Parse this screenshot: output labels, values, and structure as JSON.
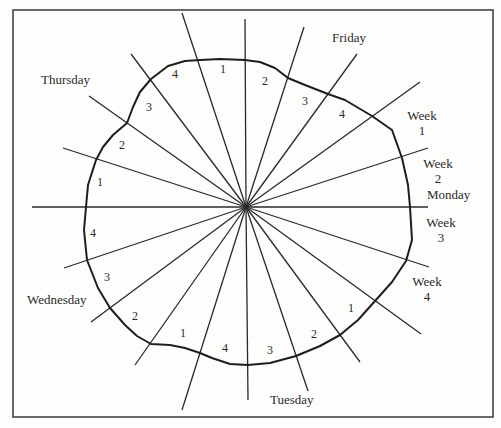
{
  "diagram": {
    "type": "radial-cycle-diagram",
    "frame": {
      "x": 13,
      "y": 10,
      "width": 480,
      "height": 407
    },
    "center": {
      "x": 246,
      "y": 207
    },
    "line_color": "#2a2a2a",
    "day_labels": {
      "thursday": "Thursday",
      "friday": "Friday",
      "monday": "Monday",
      "tuesday": "Tuesday",
      "wednesday": "Wednesday"
    },
    "week_labels": {
      "week1": {
        "word": "Week",
        "num": "1"
      },
      "week2": {
        "word": "Week",
        "num": "2"
      },
      "week3": {
        "word": "Week",
        "num": "3"
      },
      "week4": {
        "word": "Week",
        "num": "4"
      }
    },
    "segment_numbers": {
      "thu_fri": [
        "4",
        "1",
        "2",
        "3",
        "4"
      ],
      "wed_thu": [
        "1",
        "2",
        "3"
      ],
      "left": [
        "4",
        "3"
      ],
      "wed_tue": [
        "2",
        "1",
        "4",
        "3"
      ],
      "tue_mon": [
        "2",
        "1"
      ]
    },
    "rays": [
      [
        245,
        19
      ],
      [
        304,
        27
      ],
      [
        357,
        54
      ],
      [
        420,
        82
      ],
      [
        428,
        148
      ],
      [
        428,
        207
      ],
      [
        429,
        267
      ],
      [
        421,
        334
      ],
      [
        360,
        362
      ],
      [
        308,
        391
      ],
      [
        248,
        400
      ],
      [
        182,
        410
      ],
      [
        135,
        365
      ],
      [
        91,
        322
      ],
      [
        64,
        268
      ],
      [
        32,
        207
      ],
      [
        63,
        148
      ],
      [
        89,
        96
      ],
      [
        131,
        54
      ],
      [
        182,
        13
      ]
    ],
    "curve": [
      [
        245,
        60
      ],
      [
        260,
        62
      ],
      [
        275,
        68
      ],
      [
        288,
        78
      ],
      [
        305,
        85
      ],
      [
        328,
        94
      ],
      [
        345,
        100
      ],
      [
        372,
        116
      ],
      [
        392,
        130
      ],
      [
        402,
        158
      ],
      [
        408,
        185
      ],
      [
        410,
        207
      ],
      [
        412,
        240
      ],
      [
        406,
        261
      ],
      [
        392,
        282
      ],
      [
        375,
        301
      ],
      [
        358,
        320
      ],
      [
        340,
        335
      ],
      [
        320,
        346
      ],
      [
        296,
        356
      ],
      [
        270,
        363
      ],
      [
        248,
        365
      ],
      [
        230,
        364
      ],
      [
        212,
        358
      ],
      [
        200,
        353
      ],
      [
        185,
        348
      ],
      [
        170,
        345
      ],
      [
        151,
        344
      ],
      [
        137,
        336
      ],
      [
        125,
        325
      ],
      [
        110,
        308
      ],
      [
        98,
        288
      ],
      [
        87,
        260
      ],
      [
        84,
        230
      ],
      [
        86,
        207
      ],
      [
        88,
        185
      ],
      [
        96,
        160
      ],
      [
        103,
        147
      ],
      [
        113,
        135
      ],
      [
        127,
        123
      ],
      [
        133,
        107
      ],
      [
        140,
        92
      ],
      [
        151,
        79
      ],
      [
        168,
        66
      ],
      [
        185,
        61
      ],
      [
        200,
        60
      ],
      [
        220,
        59
      ],
      [
        245,
        60
      ]
    ]
  }
}
